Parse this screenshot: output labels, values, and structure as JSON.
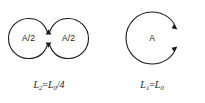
{
  "figure": {
    "background_color": "#ffffff",
    "stroke_color": "#1a1a1a",
    "left_diagram": {
      "name": "figure-eight-two-loops",
      "shape": "two tangent circles forming a figure eight",
      "loop_left_label": "A/2",
      "loop_right_label": "A/2",
      "arrowhead_count": 2,
      "caption": {
        "symbol": "L",
        "symbol_subscript": "2",
        "operator": "=",
        "value_symbol": "L",
        "value_subscript": "0",
        "value_suffix": "/4",
        "full_text": "L2=L0/4"
      }
    },
    "right_diagram": {
      "name": "single-loop-circle",
      "shape": "single circle with small gap on the right edge",
      "area_label": "A",
      "arrowhead_count": 2,
      "caption": {
        "symbol": "L",
        "symbol_subscript": "1",
        "operator": "=",
        "value_symbol": "L",
        "value_subscript": "0",
        "value_suffix": "",
        "full_text": "L1=L0"
      }
    }
  }
}
